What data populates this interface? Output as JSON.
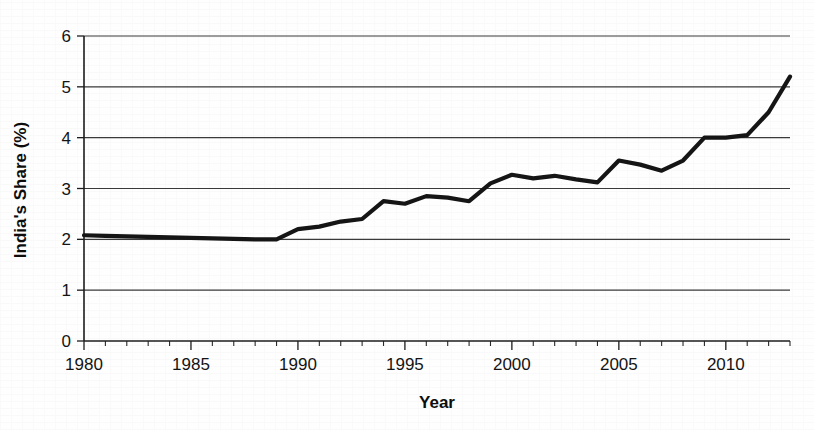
{
  "chart_data": {
    "type": "line",
    "title": "",
    "subtitle": "",
    "xlabel": "Year",
    "ylabel": "India's Share (%)",
    "xlim": [
      1980,
      2013
    ],
    "ylim": [
      0,
      6
    ],
    "grid": true,
    "legend": false,
    "legend_position": "none",
    "line_color": "#151515",
    "x_tick_labels": [
      "1980",
      "1985",
      "1990",
      "1995",
      "2000",
      "2005",
      "2010"
    ],
    "x_tick_values": [
      1980,
      1985,
      1990,
      1995,
      2000,
      2005,
      2010
    ],
    "x_minor_tick_step": 1,
    "y_tick_labels": [
      "0",
      "1",
      "2",
      "3",
      "4",
      "5",
      "6"
    ],
    "y_tick_values": [
      0,
      1,
      2,
      3,
      4,
      5,
      6
    ],
    "series": [
      {
        "name": "India's Share (%)",
        "x": [
          1980,
          1981,
          1982,
          1983,
          1984,
          1985,
          1986,
          1987,
          1988,
          1989,
          1990,
          1991,
          1992,
          1993,
          1994,
          1995,
          1996,
          1997,
          1998,
          1999,
          2000,
          2001,
          2002,
          2003,
          2004,
          2005,
          2006,
          2007,
          2008,
          2009,
          2010,
          2011,
          2012,
          2013
        ],
        "values": [
          2.08,
          2.07,
          2.06,
          2.05,
          2.04,
          2.03,
          2.02,
          2.01,
          2.0,
          2.0,
          2.2,
          2.25,
          2.35,
          2.4,
          2.75,
          2.7,
          2.85,
          2.82,
          2.75,
          3.1,
          3.27,
          3.2,
          3.25,
          3.18,
          3.12,
          3.55,
          3.47,
          3.35,
          3.55,
          4.0,
          4.0,
          4.05,
          4.5,
          5.2
        ]
      }
    ]
  },
  "axes": {
    "y_axis_title": "India's Share (%)",
    "x_axis_title": "Year"
  },
  "colors": {
    "line": "#151515",
    "grid": "#3a3a3a",
    "axis": "#1c1c1c",
    "background": "#fefefe"
  }
}
